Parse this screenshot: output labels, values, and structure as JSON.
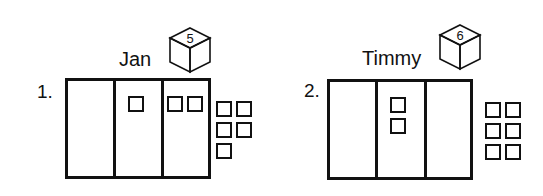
{
  "problems": [
    {
      "number": "1.",
      "name": "Jan",
      "cube_value": "5",
      "columns": 3,
      "column_counts": [
        0,
        1,
        2
      ],
      "extra_blocks": 5
    },
    {
      "number": "2.",
      "name": "Timmy",
      "cube_value": "6",
      "columns": 3,
      "column_counts": [
        0,
        2,
        0
      ],
      "extra_blocks": 6
    }
  ],
  "colors": {
    "ink": "#111111",
    "background": "#ffffff"
  }
}
